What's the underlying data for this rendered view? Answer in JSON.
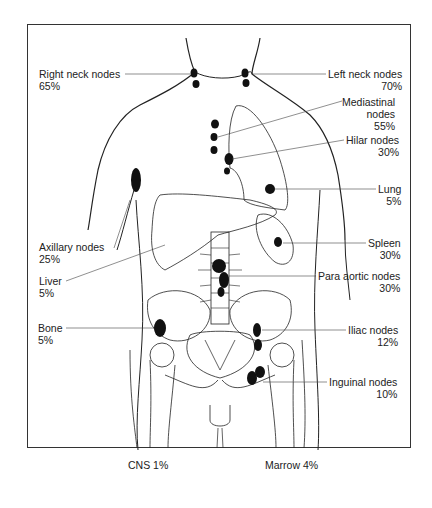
{
  "diagram": {
    "title": "",
    "labels": [
      {
        "id": "right-neck",
        "name": "Right neck nodes",
        "pct": "65%"
      },
      {
        "id": "left-neck",
        "name": "Left neck nodes",
        "pct": "70%"
      },
      {
        "id": "mediastinal",
        "name": "Mediastinal",
        "name2": "nodes",
        "pct": "55%"
      },
      {
        "id": "hilar",
        "name": "Hilar nodes",
        "pct": "30%"
      },
      {
        "id": "lung",
        "name": "Lung",
        "pct": "5%"
      },
      {
        "id": "axillary",
        "name": "Axillary nodes",
        "pct": "25%"
      },
      {
        "id": "spleen",
        "name": "Spleen",
        "pct": "30%"
      },
      {
        "id": "liver",
        "name": "Liver",
        "pct": "5%"
      },
      {
        "id": "para-aortic",
        "name": "Para aortic nodes",
        "pct": "30%"
      },
      {
        "id": "bone",
        "name": "Bone",
        "pct": "5%"
      },
      {
        "id": "iliac",
        "name": "Iliac nodes",
        "pct": "12%"
      },
      {
        "id": "inguinal",
        "name": "Inguinal nodes",
        "pct": "10%"
      },
      {
        "id": "cns",
        "name": "CNS 1%"
      },
      {
        "id": "marrow",
        "name": "Marrow 4%"
      }
    ],
    "colors": {
      "line": "#222222",
      "lesion": "#111111",
      "background": "#ffffff"
    }
  }
}
